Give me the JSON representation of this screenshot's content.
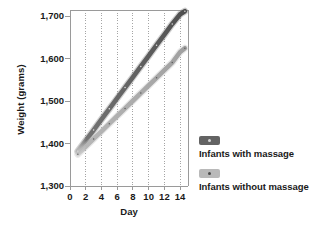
{
  "chart_data": {
    "type": "line",
    "title": "",
    "xlabel": "Day",
    "ylabel": "Weight (grams)",
    "xlim": [
      0,
      15
    ],
    "ylim": [
      1300,
      1715
    ],
    "xticks": [
      "0",
      "2",
      "4",
      "6",
      "8",
      "10",
      "12",
      "14"
    ],
    "xtick_values": [
      0,
      2,
      4,
      6,
      8,
      10,
      12,
      14
    ],
    "yticks": [
      "1,300",
      "1,400",
      "1,500",
      "1,600",
      "1,700"
    ],
    "ytick_values": [
      1300,
      1400,
      1500,
      1600,
      1700
    ],
    "grid": "vertical-dotted",
    "legend_position": "right",
    "series": [
      {
        "name": "Infants with massage",
        "color": "#5b5b5b",
        "band_color": "#7c7c7c",
        "x": [
          1,
          2,
          3,
          4,
          5,
          6,
          7,
          8,
          9,
          10,
          11,
          12,
          13,
          14,
          14.6
        ],
        "values": [
          1382,
          1407,
          1432,
          1457,
          1482,
          1507,
          1532,
          1557,
          1582,
          1607,
          1632,
          1657,
          1682,
          1705,
          1712
        ]
      },
      {
        "name": "Infants without massage",
        "color": "#a9a9a9",
        "band_color": "#bfbfbf",
        "x": [
          1,
          2,
          3,
          4,
          5,
          6,
          7,
          8,
          9,
          10,
          11,
          12,
          13,
          14,
          14.6
        ],
        "values": [
          1375,
          1393,
          1411,
          1429,
          1447,
          1465,
          1483,
          1501,
          1519,
          1537,
          1555,
          1573,
          1591,
          1616,
          1625
        ]
      }
    ]
  },
  "legend": {
    "entries": [
      {
        "label": "Infants with massage",
        "swatch_color": "#636363",
        "dot_color": "#d6d6d6"
      },
      {
        "label": "Infants without massage",
        "swatch_color": "#b9b9b9",
        "dot_color": "#4a4a4a"
      }
    ]
  },
  "axes": {
    "axis_color": "#9a9a9a",
    "grid_color": "#8e8e8e",
    "background": "#ffffff"
  }
}
